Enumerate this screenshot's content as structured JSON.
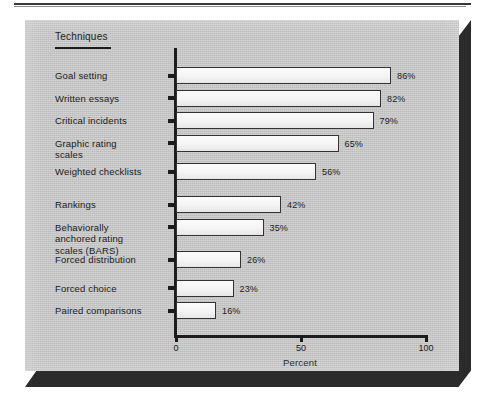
{
  "figure": {
    "column_header": "Techniques",
    "background_color": "#c9c9c9",
    "bar_fill_color": "#f7f7f7",
    "bar_border_color": "#333333",
    "axis_color": "#1c1c1c",
    "text_color": "#1b1b1b"
  },
  "chart_data": {
    "type": "bar",
    "orientation": "horizontal",
    "title": "",
    "subtitle": "",
    "xlabel": "Percent",
    "ylabel": "Techniques",
    "xlim": [
      0,
      100
    ],
    "xticks": [
      0,
      50,
      100
    ],
    "xtick_labels": [
      "0",
      "50",
      "100"
    ],
    "grid": false,
    "legend": null,
    "value_suffix": "%",
    "categories": [
      "Goal setting",
      "Written essays",
      "Critical incidents",
      "Graphic rating\nscales",
      "Weighted checklists",
      "Rankings",
      "Behaviorally\nanchored rating\nscales (BARS)",
      "Forced distribution",
      "Forced choice",
      "Paired comparisons"
    ],
    "values": [
      86,
      82,
      79,
      65,
      56,
      42,
      35,
      26,
      23,
      16
    ],
    "value_labels": [
      "86%",
      "82%",
      "79%",
      "65%",
      "56%",
      "42%",
      "35%",
      "26%",
      "23%",
      "16%"
    ],
    "groups": [
      {
        "name": "group-1",
        "category_indices": [
          0,
          1,
          2,
          3,
          4
        ]
      },
      {
        "name": "group-2",
        "category_indices": [
          5,
          6
        ]
      },
      {
        "name": "group-3",
        "category_indices": [
          7
        ]
      },
      {
        "name": "group-4",
        "category_indices": [
          8,
          9
        ]
      }
    ]
  }
}
